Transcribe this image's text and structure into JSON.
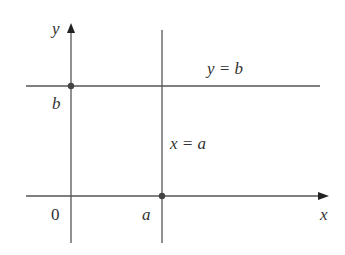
{
  "diagram": {
    "axes": {
      "x_label": "x",
      "y_label": "y",
      "origin_label": "0"
    },
    "horizontal_line": {
      "label": "y = b",
      "axis_mark": "b"
    },
    "vertical_line": {
      "label": "x = a",
      "axis_mark": "a"
    },
    "colors": {
      "line": "#555555",
      "point": "#444444",
      "background": "#ffffff"
    }
  }
}
